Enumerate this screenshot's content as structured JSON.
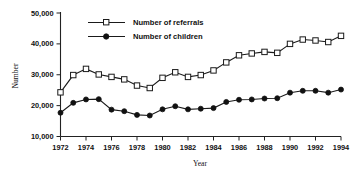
{
  "chart_data": {
    "type": "line",
    "title": "",
    "xlabel": "Year",
    "ylabel": "Number",
    "x": [
      1972,
      1973,
      1974,
      1975,
      1976,
      1977,
      1978,
      1979,
      1980,
      1981,
      1982,
      1983,
      1984,
      1985,
      1986,
      1987,
      1988,
      1989,
      1990,
      1991,
      1992,
      1993,
      1994
    ],
    "xlim": [
      1972,
      1994
    ],
    "ylim": [
      10000,
      50000
    ],
    "ytick_labels": [
      "10,000",
      "20,000",
      "30,000",
      "40,000",
      "50,000"
    ],
    "ytick_values": [
      10000,
      20000,
      30000,
      40000,
      50000
    ],
    "xtick_labels": [
      "1972",
      "1974",
      "1976",
      "1978",
      "1980",
      "1982",
      "1984",
      "1986",
      "1988",
      "1990",
      "1992",
      "1994"
    ],
    "xtick_values": [
      1972,
      1974,
      1976,
      1978,
      1980,
      1982,
      1984,
      1986,
      1988,
      1990,
      1992,
      1994
    ],
    "grid": false,
    "legend_position": "upper-center",
    "series": [
      {
        "name": "Number of referrals",
        "marker": "open-square",
        "values": [
          24300,
          29900,
          31900,
          30100,
          29300,
          28500,
          26500,
          25700,
          29000,
          30800,
          29300,
          29900,
          31400,
          34000,
          36300,
          36900,
          37400,
          37100,
          40000,
          41400,
          41100,
          40600,
          42600
        ]
      },
      {
        "name": "Number of children",
        "marker": "filled-circle",
        "values": [
          17700,
          20900,
          22000,
          22100,
          18700,
          18200,
          17000,
          16800,
          18800,
          19800,
          18800,
          19000,
          19200,
          21200,
          21900,
          22000,
          22300,
          22400,
          24200,
          24800,
          24800,
          24200,
          25200
        ]
      }
    ]
  },
  "legend": {
    "items": [
      {
        "label": "Number of referrals"
      },
      {
        "label": "Number of children"
      }
    ]
  }
}
